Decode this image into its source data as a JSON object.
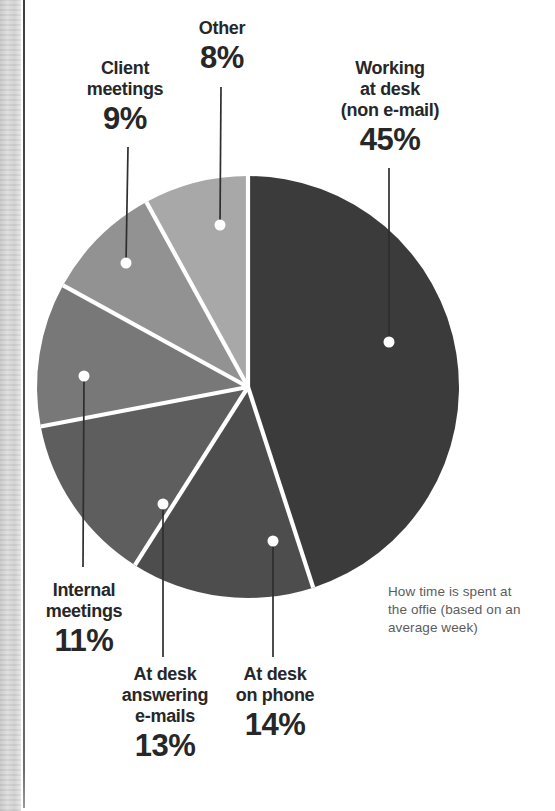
{
  "chart_data": {
    "type": "pie",
    "caption": "How time is spent at\nthe offie (based on an\naverage week)",
    "direction": "clockwise",
    "start_angle": "12 o'clock",
    "separator_color": "#ffffff",
    "leader_line_color": "#2e2e2e",
    "dot_color": "#ffffff",
    "slices": [
      {
        "name": "working-at-desk",
        "label": "Working at desk (non e-mail)",
        "callout": "Working\nat desk\n(non e-mail)",
        "pct": "45%",
        "value": 45,
        "color": "#3b3b3b"
      },
      {
        "name": "at-desk-on-phone",
        "label": "At desk on phone",
        "callout": "At desk\non phone",
        "pct": "14%",
        "value": 14,
        "color": "#4d4d4d"
      },
      {
        "name": "at-desk-answering-emails",
        "label": "At desk answering e-mails",
        "callout": "At desk\nanswering\ne-mails",
        "pct": "13%",
        "value": 13,
        "color": "#5e5e5e"
      },
      {
        "name": "internal-meetings",
        "label": "Internal meetings",
        "callout": "Internal\nmeetings",
        "pct": "11%",
        "value": 11,
        "color": "#787878"
      },
      {
        "name": "client-meetings",
        "label": "Client meetings",
        "callout": "Client\nmeetings",
        "pct": "9%",
        "value": 9,
        "color": "#929292"
      },
      {
        "name": "other",
        "label": "Other",
        "callout": "Other",
        "pct": "8%",
        "value": 8,
        "color": "#a8a8a8"
      }
    ]
  }
}
